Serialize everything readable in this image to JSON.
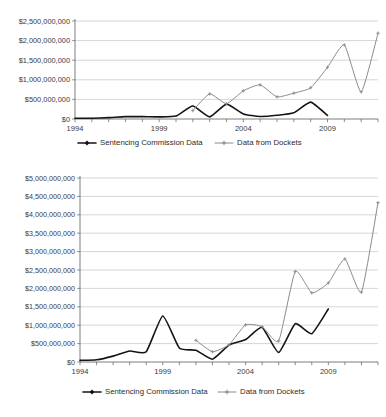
{
  "document": {
    "title": "Sentencing Commission Data vs Data from Dockets",
    "background_color": "#ffffff",
    "ink_color": "#231f20"
  },
  "palette": {
    "series_a_color": "#141414",
    "series_b_color": "#8c8c8c",
    "gridline_color": "#b9b9b9",
    "axis_color": "#6e6e6e"
  },
  "legend": {
    "series_a_label": "Sentencing Commission Data",
    "series_b_label": "Data from Dockets",
    "position": "bottom-center",
    "marker_a": "filled-diamond",
    "marker_b": "small-cross"
  },
  "chart_data": [
    {
      "id": "top-chart",
      "type": "line",
      "title": "",
      "xlabel": "",
      "ylabel": "",
      "grid": true,
      "legend_position": "bottom-center",
      "x": [
        1994,
        1995,
        1996,
        1997,
        1998,
        1999,
        2000,
        2001,
        2002,
        2003,
        2004,
        2005,
        2006,
        2007,
        2008,
        2009,
        2010,
        2011,
        2012
      ],
      "xticks": [
        1994,
        1999,
        2004,
        2009
      ],
      "xtick_labels": [
        "1994",
        "1999",
        "2004",
        "2009"
      ],
      "xlim": [
        1994,
        2012
      ],
      "ylim": [
        0,
        2500000000
      ],
      "yticks": [
        0,
        500000000,
        1000000000,
        1500000000,
        2000000000,
        2500000000
      ],
      "ytick_labels": [
        "$0",
        "$500,000,000",
        "$1,000,000,000",
        "$1,500,000,000",
        "$2,000,000,000",
        "$2,500,000,000"
      ],
      "series": [
        {
          "name": "Sentencing Commission Data",
          "color": "#141414",
          "marker": "filled-diamond",
          "values": [
            20000000,
            20000000,
            35000000,
            60000000,
            60000000,
            55000000,
            75000000,
            330000000,
            55000000,
            380000000,
            130000000,
            65000000,
            95000000,
            160000000,
            430000000,
            90000000,
            null,
            null,
            null
          ]
        },
        {
          "name": "Data from Dockets",
          "color": "#8c8c8c",
          "marker": "small-cross",
          "values": [
            null,
            null,
            null,
            null,
            null,
            null,
            null,
            215000000,
            640000000,
            390000000,
            720000000,
            870000000,
            565000000,
            660000000,
            795000000,
            1320000000,
            1890000000,
            690000000,
            2190000000
          ]
        }
      ]
    },
    {
      "id": "bottom-chart",
      "type": "line",
      "title": "",
      "xlabel": "",
      "ylabel": "",
      "grid": true,
      "legend_position": "bottom-center",
      "x": [
        1994,
        1995,
        1996,
        1997,
        1998,
        1999,
        2000,
        2001,
        2002,
        2003,
        2004,
        2005,
        2006,
        2007,
        2008,
        2009,
        2010,
        2011,
        2012
      ],
      "xticks": [
        1994,
        1999,
        2004,
        2009
      ],
      "xtick_labels": [
        "1994",
        "1999",
        "2004",
        "2009"
      ],
      "xlim": [
        1994,
        2012
      ],
      "ylim": [
        0,
        5000000000
      ],
      "yticks": [
        0,
        500000000,
        1000000000,
        1500000000,
        2000000000,
        2500000000,
        3000000000,
        3500000000,
        4000000000,
        4500000000,
        5000000000
      ],
      "ytick_labels": [
        "$0",
        "$500,000,000",
        "$1,000,000,000",
        "$1,500,000,000",
        "$2,000,000,000",
        "$2,500,000,000",
        "$3,000,000,000",
        "$3,500,000,000",
        "$4,000,000,000",
        "$4,500,000,000",
        "$5,000,000,000"
      ],
      "series": [
        {
          "name": "Sentencing Commission Data",
          "color": "#141414",
          "marker": "filled-diamond",
          "values": [
            45000000,
            60000000,
            160000000,
            300000000,
            280000000,
            1250000000,
            380000000,
            320000000,
            75000000,
            460000000,
            610000000,
            940000000,
            260000000,
            1040000000,
            770000000,
            1440000000,
            null,
            null,
            null
          ]
        },
        {
          "name": "Data from Dockets",
          "color": "#8c8c8c",
          "marker": "small-cross",
          "values": [
            null,
            null,
            null,
            null,
            null,
            null,
            null,
            590000000,
            280000000,
            470000000,
            1010000000,
            960000000,
            570000000,
            2460000000,
            1880000000,
            2150000000,
            2800000000,
            1900000000,
            4330000000
          ]
        }
      ]
    }
  ]
}
